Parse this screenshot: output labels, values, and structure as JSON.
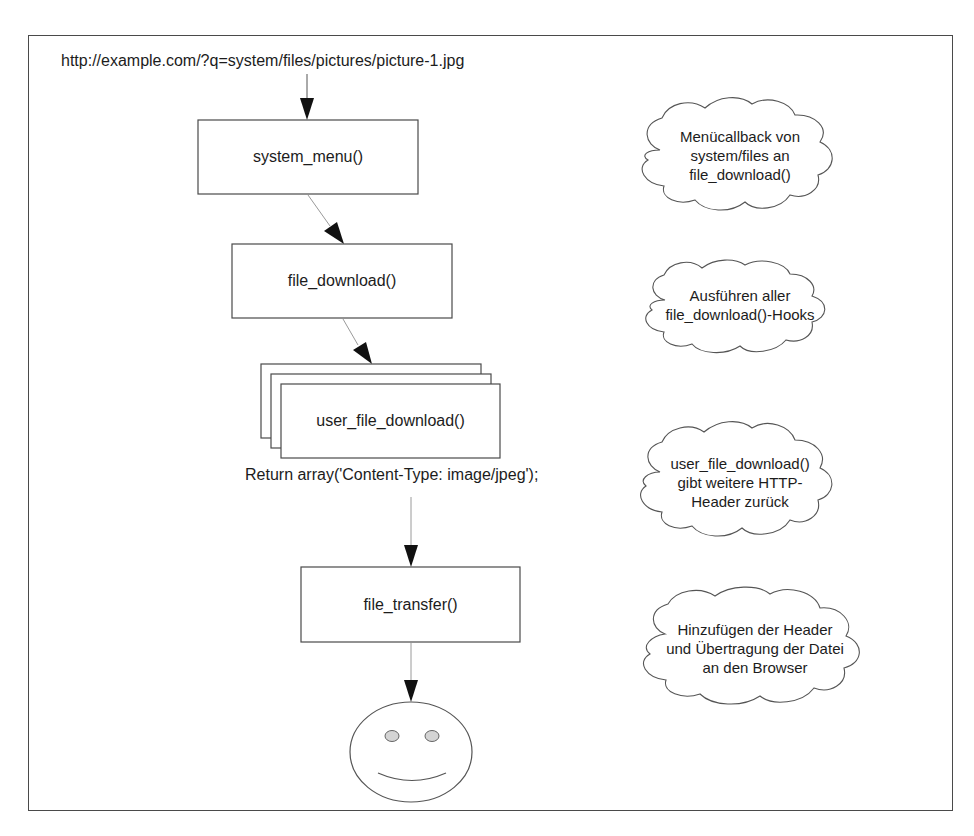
{
  "diagram": {
    "url_label": "http://example.com/?q=system/files/pictures/picture-1.jpg",
    "nodes": [
      {
        "id": "system_menu",
        "label": "system_menu()"
      },
      {
        "id": "file_download",
        "label": "file_download()"
      },
      {
        "id": "user_file_download",
        "label": "user_file_download()",
        "stacked": true
      },
      {
        "id": "file_transfer",
        "label": "file_transfer()"
      },
      {
        "id": "user",
        "label": "",
        "shape": "smiley-face"
      }
    ],
    "return_label": "Return array('Content-Type: image/jpeg');",
    "edges": [
      {
        "from": "url",
        "to": "system_menu"
      },
      {
        "from": "system_menu",
        "to": "file_download"
      },
      {
        "from": "file_download",
        "to": "user_file_download"
      },
      {
        "from": "user_file_download",
        "to": "file_transfer"
      },
      {
        "from": "file_transfer",
        "to": "user"
      }
    ],
    "notes": [
      {
        "lines": [
          "Menücallback von",
          "system/files an",
          "file_download()"
        ]
      },
      {
        "lines": [
          "Ausführen aller",
          "file_download()-Hooks"
        ]
      },
      {
        "lines": [
          "user_file_download()",
          "gibt weitere HTTP-",
          "Header zurück"
        ]
      },
      {
        "lines": [
          "Hinzufügen der Header",
          "und Übertragung der Datei",
          "an den Browser"
        ]
      }
    ]
  },
  "colors": {
    "stroke": "#4a4a4a",
    "arrow_fill": "#111111",
    "eye_fill": "#d4d4d4",
    "background": "#ffffff"
  }
}
